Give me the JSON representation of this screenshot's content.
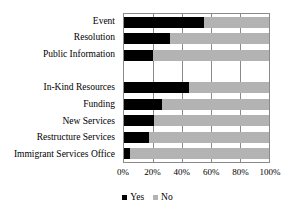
{
  "chart_data": {
    "type": "bar",
    "subtype": "stacked-horizontal-100",
    "title": "",
    "xlabel": "",
    "ylabel": "",
    "xlim": [
      0,
      100
    ],
    "grid": true,
    "legend_position": "bottom",
    "categories": [
      "Event",
      "Resolution",
      "Public Information",
      "",
      "In-Kind Resources",
      "Funding",
      "New Services",
      "Restructure Services",
      "Immigrant Services Office"
    ],
    "series": [
      {
        "name": "Yes",
        "color": "#000000",
        "values": [
          55,
          32,
          20,
          null,
          45,
          26,
          21,
          17,
          4
        ]
      },
      {
        "name": "No",
        "color": "#b3b3b3",
        "values": [
          45,
          68,
          80,
          null,
          55,
          74,
          79,
          83,
          96
        ]
      }
    ],
    "xticks": [
      {
        "value": 0,
        "label": "0%"
      },
      {
        "value": 20,
        "label": "20%"
      },
      {
        "value": 40,
        "label": "40%"
      },
      {
        "value": 60,
        "label": "60%"
      },
      {
        "value": 80,
        "label": "80%"
      },
      {
        "value": 100,
        "label": "100%"
      }
    ],
    "legend": [
      {
        "label": "Yes",
        "color": "#000000"
      },
      {
        "label": "No",
        "color": "#b3b3b3"
      }
    ]
  }
}
